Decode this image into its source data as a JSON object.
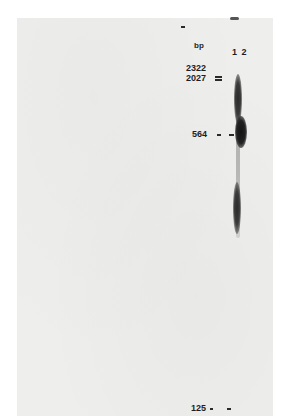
{
  "figure": {
    "type": "gel electrophoresis blot",
    "unit_label": "bp",
    "lanes": [
      "1",
      "2"
    ],
    "lanes_label": "1 2",
    "markers": [
      {
        "label": "2322",
        "y": 68
      },
      {
        "label": "2027",
        "y": 78
      },
      {
        "label": "564",
        "y": 133
      },
      {
        "label": "125",
        "y": 408
      }
    ],
    "bands": [
      {
        "lane": "2",
        "region": "high-molecular smear near 2027",
        "intensity": "strong"
      },
      {
        "lane": "2",
        "region": "564 bp",
        "intensity": "strongest"
      },
      {
        "lane": "2",
        "region": "below 564 bp (~250-300)",
        "intensity": "strong"
      }
    ],
    "colors": {
      "background": "#eeeeec",
      "band": "#1e1e1e",
      "text": "#1e1e1e"
    }
  }
}
